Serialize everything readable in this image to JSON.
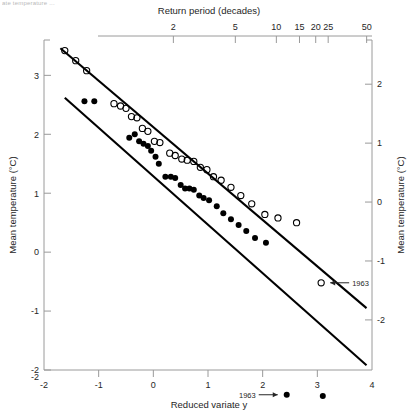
{
  "figure": {
    "partial_caption_top": "ate temperature   ...",
    "background_color": "#ffffff",
    "line_color": "#000000",
    "axis_color": "#9a9a9a"
  },
  "axes": {
    "bottom": {
      "title": "Reduced variate  y",
      "ticks": [
        -2,
        -1,
        0,
        1,
        2,
        3,
        4
      ],
      "tick_labels": [
        "-2",
        "-1",
        "0",
        "1",
        "2",
        "3",
        "4"
      ],
      "range": [
        -2,
        4
      ]
    },
    "top": {
      "title": "Return period (decades)",
      "ticks": [
        2,
        5,
        10,
        15,
        20,
        25,
        50
      ],
      "tick_labels": [
        "2",
        "5",
        "10",
        "15",
        "20",
        "25",
        "50"
      ],
      "scale": "gumbel-return-period"
    },
    "left": {
      "title": "Mean temperature (°C)",
      "ticks": [
        3,
        2,
        1,
        0,
        -1,
        -2
      ],
      "tick_labels": [
        "3",
        "2",
        "1",
        "0",
        "-1",
        "-2"
      ],
      "range": [
        -2,
        3.6
      ]
    },
    "right": {
      "title": "Mean temperature (°C)",
      "ticks": [
        2,
        1,
        0,
        -1,
        -2
      ],
      "tick_labels": [
        "2",
        "1",
        "0",
        "-1",
        "-2"
      ],
      "range": [
        -2.85,
        2.75
      ]
    }
  },
  "annotations": [
    {
      "label": "1963",
      "series": "open-circles",
      "x": 3.07,
      "y": -0.52,
      "arrow": "left"
    },
    {
      "label": "1963",
      "series": "filled-circles",
      "x": 2.44,
      "y": -2.42,
      "arrow": "right"
    }
  ],
  "chart_data": {
    "type": "scatter",
    "title": "Return period (decades)",
    "xlabel": "Reduced variate  y",
    "ylabel": "Mean temperature (°C)",
    "xlim": [
      -2,
      4
    ],
    "ylim": [
      -2,
      3.6
    ],
    "grid": false,
    "legend": "none",
    "series": [
      {
        "name": "open-circles",
        "marker": "open circle",
        "points": [
          [
            -1.62,
            3.42
          ],
          [
            -1.42,
            3.25
          ],
          [
            -1.22,
            3.08
          ],
          [
            -0.72,
            2.52
          ],
          [
            -0.6,
            2.48
          ],
          [
            -0.5,
            2.44
          ],
          [
            -0.4,
            2.3
          ],
          [
            -0.3,
            2.28
          ],
          [
            -0.2,
            2.1
          ],
          [
            -0.1,
            2.05
          ],
          [
            0.02,
            1.88
          ],
          [
            0.12,
            1.86
          ],
          [
            0.3,
            1.68
          ],
          [
            0.4,
            1.64
          ],
          [
            0.52,
            1.58
          ],
          [
            0.62,
            1.56
          ],
          [
            0.74,
            1.54
          ],
          [
            0.86,
            1.44
          ],
          [
            0.98,
            1.4
          ],
          [
            1.1,
            1.28
          ],
          [
            1.24,
            1.22
          ],
          [
            1.42,
            1.1
          ],
          [
            1.6,
            0.96
          ],
          [
            1.8,
            0.82
          ],
          [
            2.04,
            0.64
          ],
          [
            2.28,
            0.58
          ],
          [
            2.62,
            0.5
          ],
          [
            3.07,
            -0.52
          ]
        ],
        "fit_line": {
          "x0": -1.7,
          "y0": 3.46,
          "x1": 3.9,
          "y1": -0.95
        }
      },
      {
        "name": "filled-circles",
        "marker": "filled circle",
        "points": [
          [
            -1.26,
            2.56
          ],
          [
            -1.08,
            2.56
          ],
          [
            -0.44,
            1.94
          ],
          [
            -0.34,
            2.0
          ],
          [
            -0.26,
            1.88
          ],
          [
            -0.18,
            1.84
          ],
          [
            -0.1,
            1.8
          ],
          [
            -0.04,
            1.72
          ],
          [
            0.04,
            1.62
          ],
          [
            0.1,
            1.5
          ],
          [
            0.22,
            1.28
          ],
          [
            0.32,
            1.28
          ],
          [
            0.4,
            1.26
          ],
          [
            0.5,
            1.14
          ],
          [
            0.58,
            1.08
          ],
          [
            0.66,
            1.08
          ],
          [
            0.74,
            1.06
          ],
          [
            0.84,
            0.96
          ],
          [
            0.92,
            0.92
          ],
          [
            1.02,
            0.88
          ],
          [
            1.16,
            0.78
          ],
          [
            1.28,
            0.66
          ],
          [
            1.42,
            0.56
          ],
          [
            1.56,
            0.46
          ],
          [
            1.7,
            0.36
          ],
          [
            1.86,
            0.24
          ],
          [
            2.06,
            0.16
          ],
          [
            2.44,
            -2.42
          ]
        ],
        "outliers": [
          [
            3.1,
            -2.44
          ]
        ],
        "fit_line": {
          "x0": -1.62,
          "y0": 2.62,
          "x1": 3.9,
          "y1": -1.92
        }
      }
    ]
  }
}
